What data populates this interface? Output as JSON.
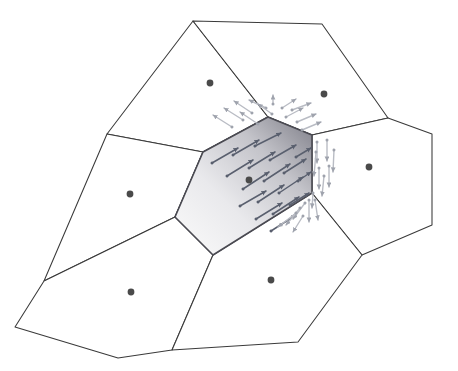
{
  "figure": {
    "kind": "voronoi-diagram-with-vector-field",
    "title": "",
    "canvas": {
      "width": 458,
      "height": 371,
      "background": "#ffffff"
    },
    "colors": {
      "cell_stroke": "#3a3a3a",
      "highlight_stroke": "#4a4a52",
      "site_dot": "#4a4a4a",
      "gradient_dark": "#808089",
      "gradient_light": "#f2f2f2",
      "arrow_inner": "#595f6e",
      "arrow_outer": "#b9bcc4",
      "page_background": "#ffffff"
    },
    "gradient": {
      "name": "highlighted-cell-shading",
      "direction": "lower-left (light) to upper-right (dark)",
      "stops": [
        {
          "offset": "0%",
          "color": "#fbfbfb"
        },
        {
          "offset": "38%",
          "color": "#e9e9ec"
        },
        {
          "offset": "70%",
          "color": "#c3c3c9"
        },
        {
          "offset": "100%",
          "color": "#7e7e88"
        }
      ]
    },
    "cells": [
      {
        "name": "cell-top-left",
        "highlighted": false,
        "points": "193,21 268,117 203,152 107,134",
        "site": {
          "x": 210,
          "y": 83
        }
      },
      {
        "name": "cell-top-right",
        "highlighted": false,
        "points": "193,21 322,24 388,118 312,135 268,117",
        "site": {
          "x": 324,
          "y": 94
        }
      },
      {
        "name": "cell-left",
        "highlighted": false,
        "points": "107,134 203,152 175,217 44,281",
        "site": {
          "x": 130,
          "y": 194
        }
      },
      {
        "name": "cell-center-highlighted",
        "highlighted": true,
        "points": "203,152 268,117 312,135 312,193 213,255 175,217",
        "site": {
          "x": 249,
          "y": 180
        }
      },
      {
        "name": "cell-right",
        "highlighted": false,
        "points": "312,135 388,118 432,134 432,225 362,255 312,193",
        "site": {
          "x": 369,
          "y": 167
        }
      },
      {
        "name": "cell-bottom-left",
        "highlighted": false,
        "points": "44,281 175,217 213,255 172,350 118,358 15,327",
        "site": {
          "x": 131,
          "y": 292
        }
      },
      {
        "name": "cell-bottom-right",
        "highlighted": false,
        "points": "213,255 312,193 362,255 298,342 172,350",
        "site": {
          "x": 271,
          "y": 280
        }
      }
    ],
    "outer_boundary": {
      "name": "tessellation-outer-boundary",
      "points": "193,21 322,24 388,118 432,134 432,225 362,255 298,342 172,350 118,358 15,327 44,281 107,134"
    },
    "sites": [
      {
        "name": "site-top-left",
        "x": 210,
        "y": 83
      },
      {
        "name": "site-top-right",
        "x": 324,
        "y": 94
      },
      {
        "name": "site-left",
        "x": 130,
        "y": 194
      },
      {
        "name": "site-center",
        "x": 249,
        "y": 180
      },
      {
        "name": "site-right",
        "x": 369,
        "y": 167
      },
      {
        "name": "site-bottom-left",
        "x": 131,
        "y": 292
      },
      {
        "name": "site-bottom-right",
        "x": 271,
        "y": 280
      }
    ],
    "vector_field": {
      "description": "arrows inside the highlighted cell point up-and-right toward its upper-right edge; arrows outside fan away across the shared edges",
      "inner_arrows": [
        {
          "x1": 212,
          "y1": 163,
          "x2": 238,
          "y2": 148
        },
        {
          "x1": 227,
          "y1": 176,
          "x2": 253,
          "y2": 160
        },
        {
          "x1": 243,
          "y1": 189,
          "x2": 269,
          "y2": 172
        },
        {
          "x1": 258,
          "y1": 202,
          "x2": 284,
          "y2": 185
        },
        {
          "x1": 273,
          "y1": 214,
          "x2": 299,
          "y2": 197
        },
        {
          "x1": 233,
          "y1": 155,
          "x2": 259,
          "y2": 140
        },
        {
          "x1": 249,
          "y1": 168,
          "x2": 275,
          "y2": 152
        },
        {
          "x1": 264,
          "y1": 181,
          "x2": 290,
          "y2": 164
        },
        {
          "x1": 279,
          "y1": 193,
          "x2": 303,
          "y2": 177
        },
        {
          "x1": 255,
          "y1": 146,
          "x2": 281,
          "y2": 133
        },
        {
          "x1": 270,
          "y1": 160,
          "x2": 296,
          "y2": 145
        },
        {
          "x1": 284,
          "y1": 173,
          "x2": 306,
          "y2": 159
        },
        {
          "x1": 240,
          "y1": 206,
          "x2": 266,
          "y2": 191
        },
        {
          "x1": 256,
          "y1": 219,
          "x2": 282,
          "y2": 203
        },
        {
          "x1": 271,
          "y1": 231,
          "x2": 296,
          "y2": 215
        },
        {
          "x1": 290,
          "y1": 205,
          "x2": 309,
          "y2": 193
        },
        {
          "x1": 296,
          "y1": 157,
          "x2": 311,
          "y2": 148
        },
        {
          "x1": 298,
          "y1": 181,
          "x2": 311,
          "y2": 172
        }
      ],
      "outer_arrows_top": [
        {
          "x1": 232,
          "y1": 127,
          "x2": 213,
          "y2": 115
        },
        {
          "x1": 243,
          "y1": 120,
          "x2": 224,
          "y2": 108
        },
        {
          "x1": 252,
          "y1": 113,
          "x2": 234,
          "y2": 101
        },
        {
          "x1": 258,
          "y1": 124,
          "x2": 240,
          "y2": 112
        },
        {
          "x1": 266,
          "y1": 108,
          "x2": 249,
          "y2": 100
        },
        {
          "x1": 272,
          "y1": 114,
          "x2": 258,
          "y2": 104
        },
        {
          "x1": 273,
          "y1": 104,
          "x2": 273,
          "y2": 95
        },
        {
          "x1": 282,
          "y1": 108,
          "x2": 296,
          "y2": 99
        },
        {
          "x1": 286,
          "y1": 117,
          "x2": 303,
          "y2": 108
        },
        {
          "x1": 292,
          "y1": 110,
          "x2": 311,
          "y2": 103
        },
        {
          "x1": 297,
          "y1": 122,
          "x2": 316,
          "y2": 114
        },
        {
          "x1": 302,
          "y1": 130,
          "x2": 321,
          "y2": 122
        }
      ],
      "outer_arrows_right": [
        {
          "x1": 317,
          "y1": 142,
          "x2": 317,
          "y2": 163
        },
        {
          "x1": 327,
          "y1": 140,
          "x2": 327,
          "y2": 161
        },
        {
          "x1": 319,
          "y1": 168,
          "x2": 319,
          "y2": 189
        },
        {
          "x1": 329,
          "y1": 166,
          "x2": 329,
          "y2": 187
        },
        {
          "x1": 316,
          "y1": 152,
          "x2": 314,
          "y2": 176
        },
        {
          "x1": 324,
          "y1": 176,
          "x2": 322,
          "y2": 196
        },
        {
          "x1": 334,
          "y1": 150,
          "x2": 333,
          "y2": 172
        },
        {
          "x1": 313,
          "y1": 193,
          "x2": 312,
          "y2": 208
        }
      ],
      "outer_arrows_bottom": [
        {
          "x1": 305,
          "y1": 203,
          "x2": 293,
          "y2": 219
        },
        {
          "x1": 300,
          "y1": 208,
          "x2": 286,
          "y2": 225
        },
        {
          "x1": 309,
          "y1": 200,
          "x2": 309,
          "y2": 222
        },
        {
          "x1": 315,
          "y1": 200,
          "x2": 318,
          "y2": 220
        },
        {
          "x1": 296,
          "y1": 213,
          "x2": 278,
          "y2": 227
        },
        {
          "x1": 303,
          "y1": 216,
          "x2": 293,
          "y2": 232
        }
      ]
    }
  }
}
